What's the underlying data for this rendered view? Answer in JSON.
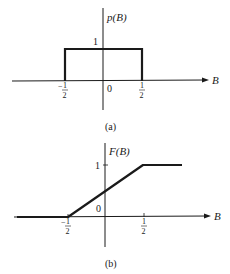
{
  "figure_a": {
    "caption": "(a)",
    "y_label": "p(B)",
    "x_label": "B",
    "y_tick_1": "1",
    "origin_label": "0",
    "x_tick_neg": "−",
    "x_tick_pos_num": "1",
    "x_tick_pos_den": "2",
    "x_tick_neg_num": "1",
    "x_tick_neg_den": "2",
    "function": "uniform density: p(B)=1 for -1/2 ≤ B ≤ 1/2, 0 otherwise"
  },
  "figure_b": {
    "caption": "(b)",
    "y_label": "F(B)",
    "x_label": "B",
    "y_tick_1": "1",
    "origin_label": "0",
    "x_tick_neg": "−",
    "x_tick_pos_num": "1",
    "x_tick_pos_den": "2",
    "x_tick_neg_num": "1",
    "x_tick_neg_den": "2",
    "function": "cumulative distribution: F(B)=0 for B<-1/2, linear 0→1 on [-1/2,1/2], 1 for B>1/2"
  }
}
